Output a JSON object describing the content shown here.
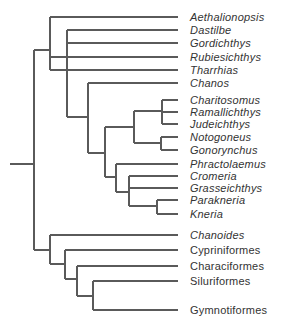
{
  "diagram": {
    "type": "cladogram",
    "line_color": "#5a5a5a",
    "text_color": "#333333",
    "leaves": [
      {
        "label": "Aethalionopsis",
        "italic": true,
        "y": 17
      },
      {
        "label": "Dastilbe",
        "italic": true,
        "y": 30
      },
      {
        "label": "Gordichthys",
        "italic": true,
        "y": 43
      },
      {
        "label": "Rubiesichthys",
        "italic": true,
        "y": 57
      },
      {
        "label": "Tharrhias",
        "italic": true,
        "y": 70
      },
      {
        "label": "Chanos",
        "italic": true,
        "y": 83
      },
      {
        "label": "Charitosomus",
        "italic": true,
        "y": 100
      },
      {
        "label": "Ramallichthys",
        "italic": true,
        "y": 112
      },
      {
        "label": "Judeichthys",
        "italic": true,
        "y": 124
      },
      {
        "label": "Notogoneus",
        "italic": true,
        "y": 137
      },
      {
        "label": "Gonorynchus",
        "italic": true,
        "y": 150
      },
      {
        "label": "Phractolaemus",
        "italic": true,
        "y": 164
      },
      {
        "label": "Cromeria",
        "italic": true,
        "y": 176
      },
      {
        "label": "Grasseichthys",
        "italic": true,
        "y": 188
      },
      {
        "label": "Parakneria",
        "italic": true,
        "y": 200
      },
      {
        "label": "Kneria",
        "italic": true,
        "y": 214
      },
      {
        "label": "Chanoides",
        "italic": true,
        "y": 235
      },
      {
        "label": "Cypriniformes",
        "italic": false,
        "y": 250
      },
      {
        "label": "Characiformes",
        "italic": false,
        "y": 266
      },
      {
        "label": "Siluriformes",
        "italic": false,
        "y": 281
      },
      {
        "label": "Gymnotiformes",
        "italic": false,
        "y": 310
      }
    ],
    "branches": [
      [
        10,
        164,
        34,
        164
      ],
      [
        34,
        50,
        34,
        250
      ],
      [
        34,
        50,
        50,
        50
      ],
      [
        50,
        17,
        50,
        70
      ],
      [
        50,
        17,
        178,
        17
      ],
      [
        50,
        70,
        178,
        70
      ],
      [
        50,
        57,
        67,
        57
      ],
      [
        67,
        30,
        67,
        117
      ],
      [
        67,
        30,
        178,
        30
      ],
      [
        67,
        43,
        178,
        43
      ],
      [
        67,
        57,
        178,
        57
      ],
      [
        67,
        117,
        88,
        117
      ],
      [
        88,
        83,
        88,
        153
      ],
      [
        88,
        83,
        178,
        83
      ],
      [
        88,
        153,
        105,
        153
      ],
      [
        105,
        127,
        105,
        177
      ],
      [
        105,
        127,
        134,
        127
      ],
      [
        134,
        111,
        134,
        143
      ],
      [
        134,
        111,
        162,
        111
      ],
      [
        162,
        100,
        162,
        124
      ],
      [
        162,
        100,
        178,
        100
      ],
      [
        162,
        112,
        178,
        112
      ],
      [
        162,
        124,
        178,
        124
      ],
      [
        134,
        143,
        161,
        143
      ],
      [
        161,
        137,
        161,
        150
      ],
      [
        161,
        137,
        178,
        137
      ],
      [
        161,
        150,
        178,
        150
      ],
      [
        105,
        177,
        116,
        177
      ],
      [
        116,
        164,
        116,
        192
      ],
      [
        116,
        164,
        178,
        164
      ],
      [
        116,
        192,
        129,
        192
      ],
      [
        129,
        176,
        129,
        206
      ],
      [
        129,
        176,
        178,
        176
      ],
      [
        129,
        188,
        178,
        188
      ],
      [
        129,
        206,
        157,
        206
      ],
      [
        157,
        200,
        157,
        214
      ],
      [
        157,
        200,
        178,
        200
      ],
      [
        157,
        214,
        178,
        214
      ],
      [
        34,
        250,
        50,
        250
      ],
      [
        50,
        235,
        50,
        264
      ],
      [
        50,
        235,
        178,
        235
      ],
      [
        50,
        264,
        65,
        264
      ],
      [
        65,
        250,
        65,
        279
      ],
      [
        65,
        250,
        178,
        250
      ],
      [
        65,
        279,
        77,
        279
      ],
      [
        77,
        266,
        77,
        296
      ],
      [
        77,
        266,
        178,
        266
      ],
      [
        77,
        296,
        93,
        296
      ],
      [
        93,
        281,
        93,
        310
      ],
      [
        93,
        281,
        178,
        281
      ],
      [
        93,
        310,
        178,
        310
      ]
    ]
  }
}
